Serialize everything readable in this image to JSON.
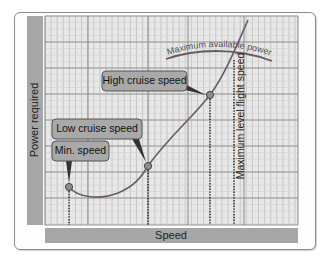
{
  "diagram": {
    "y_axis_label": "Power required",
    "x_axis_label": "Speed",
    "curves": {
      "power_required": "Power required curve",
      "max_available": "Maximum available power"
    },
    "callouts": [
      {
        "id": "min",
        "label": "Min. speed"
      },
      {
        "id": "low",
        "label": "Low cruise speed"
      },
      {
        "id": "high",
        "label": "High cruise speed"
      }
    ],
    "max_level_label": "Maximum level flight speed",
    "colors": {
      "axis_bar": "#a6a6a6",
      "grid_bg": "#e8e8e8",
      "grid_minor": "#c6c6c6",
      "grid_major": "#8a8a8a",
      "curve": "#6b5a66",
      "callout_fill": "#a9a9a9",
      "callout_border": "#555555",
      "point_fill": "#8d8d8d"
    }
  },
  "chart_data": {
    "type": "line",
    "title": "",
    "xlabel": "Speed",
    "ylabel": "Power required",
    "grid": true,
    "series": [
      {
        "name": "Power required",
        "points": [
          [
            0.12,
            0.22
          ],
          [
            0.2,
            0.16
          ],
          [
            0.3,
            0.17
          ],
          [
            0.41,
            0.28
          ],
          [
            0.55,
            0.47
          ],
          [
            0.67,
            0.73
          ],
          [
            0.8,
            1.05
          ]
        ]
      },
      {
        "name": "Maximum available power",
        "points": [
          [
            0.45,
            0.84
          ],
          [
            0.6,
            0.87
          ],
          [
            0.72,
            0.86
          ],
          [
            0.8,
            0.8
          ]
        ]
      }
    ],
    "annotations": [
      {
        "label": "Min. speed",
        "x": 0.12
      },
      {
        "label": "Low cruise speed",
        "x": 0.41
      },
      {
        "label": "High cruise speed",
        "x": 0.67
      },
      {
        "label": "Maximum level flight speed",
        "x": 0.74
      }
    ],
    "xlim": [
      0,
      1
    ],
    "ylim": [
      0,
      1
    ]
  }
}
